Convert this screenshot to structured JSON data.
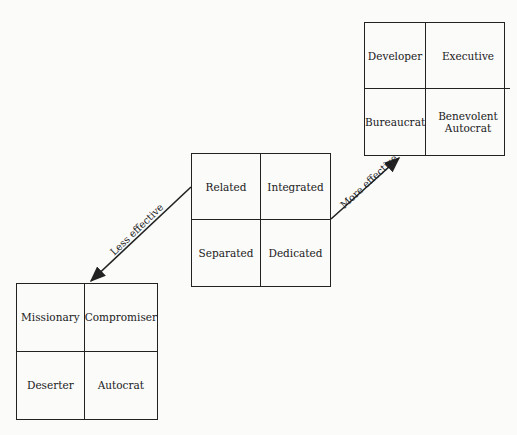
{
  "diagram": {
    "center_grid": {
      "cells": [
        "Related",
        "Integrated",
        "Separated",
        "Dedicated"
      ]
    },
    "more_effective_grid": {
      "cells": [
        "Developer",
        "Executive",
        "Bureaucrat",
        "Benevolent Autocrat"
      ]
    },
    "less_effective_grid": {
      "cells": [
        "Missionary",
        "Compromiser",
        "Deserter",
        "Autocrat"
      ]
    },
    "arrows": {
      "more_label": "More effective",
      "less_label": "Less effective"
    },
    "colors": {
      "line": "#222222",
      "background": "#fbfbfa"
    }
  }
}
